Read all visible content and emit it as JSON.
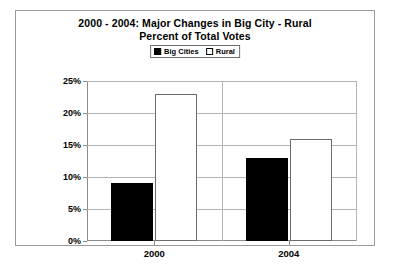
{
  "chart_data": {
    "type": "bar",
    "title": "2000 - 2004:  Major Changes in Big City - Rural",
    "subtitle": "Percent of Total Votes",
    "title_lines": [
      "2000 - 2004:  Major Changes in Big City - Rural",
      "Percent of Total Votes"
    ],
    "categories": [
      "2000",
      "2004"
    ],
    "series": [
      {
        "name": "Big Cities",
        "values": [
          9,
          13
        ],
        "color": "#000000",
        "swatch": "filled"
      },
      {
        "name": "Rural",
        "values": [
          23,
          16
        ],
        "color": "#ffffff",
        "swatch": "hollow"
      }
    ],
    "xlabel": "",
    "ylabel": "",
    "ylim": [
      0,
      25
    ],
    "ytick_values": [
      0,
      5,
      10,
      15,
      20,
      25
    ],
    "ytick_labels": [
      "0%",
      "5%",
      "10%",
      "15%",
      "20%",
      "25%"
    ],
    "grid": true,
    "legend_position": "top-center",
    "legend_entries": [
      "Big Cities",
      "Rural"
    ],
    "value_suffix": "%"
  },
  "frame": {
    "border_color": "#9a9a9a",
    "background": "#ffffff"
  }
}
